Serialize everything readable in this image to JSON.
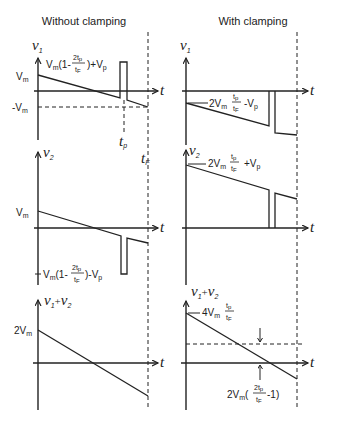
{
  "titles": {
    "left": "Without clamping",
    "right": "With clamping"
  },
  "axes": {
    "time_symbol": "t",
    "v1": "v",
    "v1_sub": "1",
    "v2": "v",
    "v2_sub": "2",
    "sum": "v",
    "sum_sub1": "1",
    "sum_plus": "+",
    "sum_sub2": "2"
  },
  "left": {
    "v1": {
      "vm": "V",
      "vm_sub": "m",
      "neg_vm": "-V",
      "neg_vm_sub": "m",
      "peak_label_pre": "V",
      "peak_label_sub": "m",
      "peak_label_mid": "(1-",
      "frac_num": "2t",
      "frac_num_sub": "p",
      "frac_den": "t",
      "frac_den_sub": "F",
      "peak_label_post": ")+V",
      "peak_label_post_sub": "p",
      "tp": "t",
      "tp_sub": "p",
      "tf": "t",
      "tf_sub": "F"
    },
    "v2": {
      "vm": "V",
      "vm_sub": "m",
      "low_label_pre": "V",
      "low_label_sub": "m",
      "low_label_mid": "(1-",
      "frac_num": "2t",
      "frac_num_sub": "p",
      "frac_den": "t",
      "frac_den_sub": "F",
      "low_label_post": ")-V",
      "low_label_post_sub": "p"
    },
    "sum": {
      "start": "2V",
      "start_sub": "m"
    }
  },
  "right": {
    "v1": {
      "label_pre": "2V",
      "label_sub": "m",
      "frac_num": "t",
      "frac_num_sub": "p",
      "frac_den": "t",
      "frac_den_sub": "F",
      "label_post": "-V",
      "label_post_sub": "p"
    },
    "v2": {
      "label_pre": "2V",
      "label_sub": "m",
      "frac_num": "t",
      "frac_num_sub": "p",
      "frac_den": "t",
      "frac_den_sub": "F",
      "label_post": "+V",
      "label_post_sub": "p"
    },
    "sum": {
      "start_pre": "4V",
      "start_sub": "m",
      "frac_num": "t",
      "frac_num_sub": "p",
      "frac_den": "t",
      "frac_den_sub": "F",
      "offset_pre": "2V",
      "offset_sub": "m",
      "offset_mid": "(",
      "offset_frac_num": "2t",
      "offset_frac_num_sub": "p",
      "offset_frac_den": "t",
      "offset_frac_den_sub": "F",
      "offset_post": "-1)"
    }
  }
}
